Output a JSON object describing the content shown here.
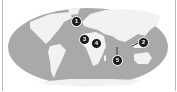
{
  "map": {
    "projection": "robinson-style world map",
    "ocean_color": "#a9a9a9",
    "land_color": "#f2f2f2",
    "border_color": "#b8b8b8",
    "markers": [
      {
        "label": "1",
        "x": 76,
        "y": 21,
        "region": "Western Europe / North Atlantic"
      },
      {
        "label": "2",
        "x": 143,
        "y": 42,
        "region": "Southeast Asia / Philippines"
      },
      {
        "label": "3",
        "x": 84,
        "y": 39,
        "region": "West Africa"
      },
      {
        "label": "4",
        "x": 96,
        "y": 43,
        "region": "East-Central Africa"
      },
      {
        "label": "5",
        "x": 117,
        "y": 60,
        "region": "Indian Ocean"
      }
    ]
  }
}
